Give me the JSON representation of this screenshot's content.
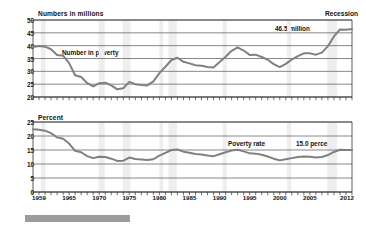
{
  "chart_data": [
    {
      "type": "line",
      "panel": "top",
      "title": "Numbers in millions",
      "ylabel": "Numbers in millions",
      "xlabel": "",
      "ylim": [
        20,
        50
      ],
      "yticks": [
        20,
        25,
        30,
        35,
        40,
        45,
        50
      ],
      "xlim": [
        1959,
        2012
      ],
      "xticks": [
        1959,
        1965,
        1970,
        1975,
        1980,
        1985,
        1990,
        1995,
        2000,
        2005,
        2012
      ],
      "grid": true,
      "legend_position": "inline",
      "series_label": "Number in poverty",
      "annotations": [
        {
          "text": "Recession",
          "x": 2012,
          "y": 50
        },
        {
          "text": "46.5 million",
          "x": 2011,
          "y": 47.5
        }
      ],
      "x": [
        1959,
        1960,
        1961,
        1962,
        1963,
        1964,
        1965,
        1966,
        1967,
        1968,
        1969,
        1970,
        1971,
        1972,
        1973,
        1974,
        1975,
        1976,
        1977,
        1978,
        1979,
        1980,
        1981,
        1982,
        1983,
        1984,
        1985,
        1986,
        1987,
        1988,
        1989,
        1990,
        1991,
        1992,
        1993,
        1994,
        1995,
        1996,
        1997,
        1998,
        1999,
        2000,
        2001,
        2002,
        2003,
        2004,
        2005,
        2006,
        2007,
        2008,
        2009,
        2010,
        2011,
        2012
      ],
      "values": [
        39.5,
        39.9,
        39.6,
        38.6,
        36.4,
        36.1,
        33.2,
        28.5,
        27.8,
        25.4,
        24.1,
        25.4,
        25.6,
        24.5,
        23.0,
        23.4,
        25.9,
        25.0,
        24.7,
        24.5,
        26.1,
        29.3,
        31.8,
        34.4,
        35.3,
        33.7,
        33.1,
        32.4,
        32.2,
        31.7,
        31.5,
        33.6,
        35.7,
        38.0,
        39.3,
        38.1,
        36.4,
        36.5,
        35.6,
        34.5,
        32.8,
        31.6,
        32.9,
        34.6,
        35.9,
        37.0,
        37.0,
        36.5,
        37.3,
        39.8,
        43.6,
        46.3,
        46.2,
        46.5
      ],
      "recession_bands": [
        [
          1960.3,
          1961.1
        ],
        [
          1969.9,
          1970.9
        ],
        [
          1973.9,
          1975.2
        ],
        [
          1980.0,
          1980.6
        ],
        [
          1981.5,
          1982.9
        ],
        [
          1990.5,
          1991.2
        ],
        [
          2001.2,
          2001.9
        ],
        [
          2007.9,
          2009.5
        ]
      ]
    },
    {
      "type": "line",
      "panel": "bottom",
      "title": "Percent",
      "ylabel": "Percent",
      "xlabel": "",
      "ylim": [
        0,
        25
      ],
      "yticks": [
        0,
        5,
        10,
        15,
        20,
        25
      ],
      "xlim": [
        1959,
        2012
      ],
      "xticks": [
        1959,
        1965,
        1970,
        1975,
        1980,
        1985,
        1990,
        1995,
        2000,
        2005,
        2012
      ],
      "grid": true,
      "legend_position": "inline",
      "series_label": "Poverty rate",
      "annotations": [
        {
          "text": "15.0 percent",
          "x": 2009,
          "y": 18
        }
      ],
      "x": [
        1959,
        1960,
        1961,
        1962,
        1963,
        1964,
        1965,
        1966,
        1967,
        1968,
        1969,
        1970,
        1971,
        1972,
        1973,
        1974,
        1975,
        1976,
        1977,
        1978,
        1979,
        1980,
        1981,
        1982,
        1983,
        1984,
        1985,
        1986,
        1987,
        1988,
        1989,
        1990,
        1991,
        1992,
        1993,
        1994,
        1995,
        1996,
        1997,
        1998,
        1999,
        2000,
        2001,
        2002,
        2003,
        2004,
        2005,
        2006,
        2007,
        2008,
        2009,
        2010,
        2011,
        2012
      ],
      "values": [
        22.4,
        22.2,
        21.9,
        21.0,
        19.5,
        19.0,
        17.3,
        14.7,
        14.2,
        12.8,
        12.1,
        12.6,
        12.5,
        11.9,
        11.1,
        11.2,
        12.3,
        11.8,
        11.6,
        11.4,
        11.7,
        13.0,
        14.0,
        15.0,
        15.2,
        14.4,
        14.0,
        13.6,
        13.4,
        13.0,
        12.8,
        13.5,
        14.2,
        14.8,
        15.1,
        14.5,
        13.8,
        13.7,
        13.3,
        12.7,
        11.9,
        11.3,
        11.7,
        12.1,
        12.5,
        12.7,
        12.6,
        12.3,
        12.5,
        13.2,
        14.3,
        15.1,
        15.0,
        15.0
      ],
      "recession_bands": [
        [
          1960.3,
          1961.1
        ],
        [
          1969.9,
          1970.9
        ],
        [
          1973.9,
          1975.2
        ],
        [
          1980.0,
          1980.6
        ],
        [
          1981.5,
          1982.9
        ],
        [
          1990.5,
          1991.2
        ],
        [
          2001.2,
          2001.9
        ],
        [
          2007.9,
          2009.5
        ]
      ]
    }
  ],
  "colors": {
    "series_line": "#808080",
    "gridline": "#555555",
    "axis": "#333333",
    "recession_band": "#eeeeee",
    "bottom_bar": "#9b9b9b",
    "text": "#111111"
  },
  "top_panel": {
    "axis_title": "Numbers in millions",
    "recession_note": "Recession",
    "value_label": "46.5 million",
    "series_label": "Number in poverty",
    "yticks": [
      "50",
      "45",
      "40",
      "35",
      "30",
      "25",
      "20"
    ]
  },
  "bottom_panel": {
    "axis_title": "Percent",
    "series_label": "Poverty rate",
    "value_label": "15.0 percent",
    "yticks": [
      "25",
      "20",
      "15",
      "10",
      "5",
      "0"
    ],
    "xticks": [
      "1959",
      "1965",
      "1970",
      "1975",
      "1980",
      "1985",
      "1990",
      "1995",
      "2000",
      "2005",
      "2012"
    ]
  }
}
